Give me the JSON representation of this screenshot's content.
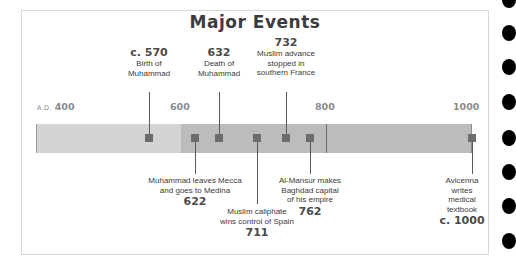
{
  "title": "Major Events",
  "axis": {
    "era": "A.D.",
    "labels": [
      "400",
      "600",
      "800",
      "1000"
    ]
  },
  "colors": {
    "bar_early": "#d4d4d4",
    "bar_late": "#bcbcbc",
    "marker": "#6c6c6c"
  },
  "events_above": [
    {
      "year": "c. 570",
      "text_1": "Birth of",
      "text_2": "Muhammad",
      "text_3": ""
    },
    {
      "year": "632",
      "text_1": "Death of",
      "text_2": "Muhammad",
      "text_3": ""
    },
    {
      "year": "732",
      "text_1": "Muslim advance",
      "text_2": "stopped in",
      "text_3": "southern France"
    }
  ],
  "events_below": [
    {
      "year": "622",
      "text_1": "Muhammad leaves Mecca",
      "text_2": "and goes to Medina",
      "text_3": ""
    },
    {
      "year": "711",
      "text_1": "Muslim caliphate",
      "text_2": "wins control of Spain",
      "text_3": ""
    },
    {
      "year": "762",
      "text_1": "Al-Mansur makes",
      "text_2": "Baghdad capital",
      "text_3": "of his empire"
    },
    {
      "year": "c. 1000",
      "text_1": "Avicenna",
      "text_2": "writes",
      "text_3": "medical",
      "text_4": "textbook"
    }
  ]
}
